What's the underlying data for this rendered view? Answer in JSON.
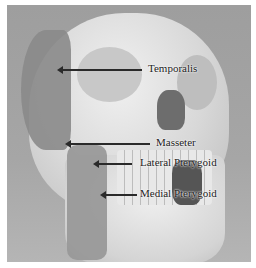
{
  "figure": {
    "labels": [
      {
        "id": "temporalis",
        "text": "Temporalis"
      },
      {
        "id": "masseter",
        "text": "Masseter"
      },
      {
        "id": "lateral_pterygoid",
        "text": "Lateral Pterygoid"
      },
      {
        "id": "medial_pterygoid",
        "text": "Medial Pterygoid"
      }
    ]
  }
}
